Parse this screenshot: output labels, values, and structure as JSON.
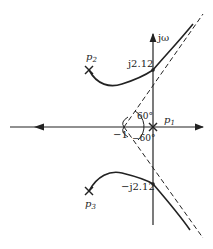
{
  "diagram": {
    "type": "root-locus",
    "axes": {
      "imag_label": "jω",
      "real_axis_label": ""
    },
    "poles": [
      {
        "id": "p1",
        "label": "p",
        "sub": "1"
      },
      {
        "id": "p2",
        "label": "p",
        "sub": "2"
      },
      {
        "id": "p3",
        "label": "p",
        "sub": "3"
      }
    ],
    "crossings": {
      "upper": "j2.12",
      "lower": "−j2.12"
    },
    "centroid_label": "−1",
    "angles": {
      "upper": "60°",
      "lower": "−60°"
    },
    "colors": {
      "line": "#222222",
      "background": "#ffffff"
    }
  }
}
